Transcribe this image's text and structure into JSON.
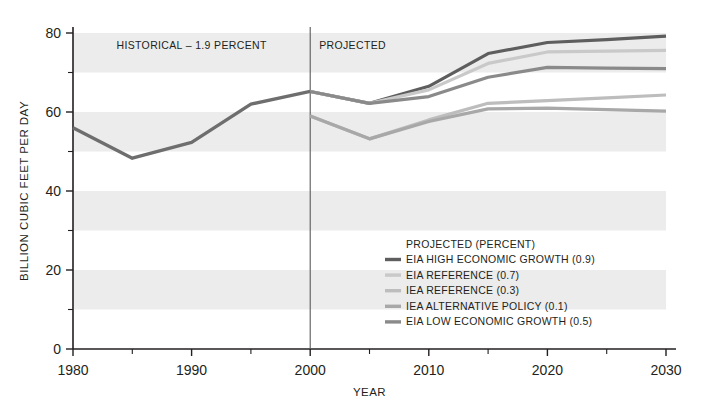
{
  "chart_data": {
    "type": "line",
    "title": "",
    "xlabel": "YEAR",
    "ylabel": "BILLION CUBIC FEET PER DAY",
    "xlim": [
      1980,
      2030
    ],
    "ylim": [
      0,
      80
    ],
    "xticks": [
      1980,
      1990,
      2000,
      2010,
      2020,
      2030
    ],
    "xtick_labels": [
      "1980",
      "1990",
      "2000",
      "2010",
      "2020",
      "2030"
    ],
    "xminor_ticks": [
      1985,
      1995,
      2005,
      2015,
      2025
    ],
    "yticks": [
      0,
      20,
      40,
      60,
      80
    ],
    "ytick_labels": [
      "0",
      "20",
      "40",
      "60",
      "80"
    ],
    "yminor_ticks": [
      10,
      30,
      50,
      70
    ],
    "grid": false,
    "bands": [
      [
        70,
        80
      ],
      [
        50,
        60
      ],
      [
        30,
        40
      ],
      [
        10,
        20
      ]
    ],
    "band_color": "#ececec",
    "divider_x": 2000,
    "legend_position": "inside-lower-right",
    "annotations": [
      {
        "name": "historical-label",
        "text": "HISTORICAL – 1.9 PERCENT",
        "x": 1990,
        "y": 77
      },
      {
        "name": "projected-label",
        "text": "PROJECTED",
        "x": 2003.5,
        "y": 77
      }
    ],
    "legend_title": "PROJECTED (PERCENT)",
    "series": [
      {
        "name": "EIA HIGH ECONOMIC GROWTH (0.9)",
        "label": "EIA HIGH ECONOMIC GROWTH (0.9)",
        "color": "#5e5e5e",
        "width": 3.2,
        "x": [
          2000,
          2005,
          2010,
          2015,
          2020,
          2025,
          2030
        ],
        "values": [
          65.2,
          62.2,
          66.5,
          74.8,
          77.6,
          78.3,
          79.2
        ]
      },
      {
        "name": "EIA REFERENCE (0.7)",
        "label": "EIA REFERENCE (0.7)",
        "color": "#c9c9c9",
        "width": 3.2,
        "x": [
          2000,
          2005,
          2010,
          2015,
          2020,
          2025,
          2030
        ],
        "values": [
          65.2,
          62.2,
          65.6,
          72.3,
          75.2,
          75.4,
          75.6
        ]
      },
      {
        "name": "IEA REFERENCE (0.3)",
        "label": "IEA REFERENCE (0.3)",
        "color": "#bdbdbd",
        "width": 3.2,
        "x": [
          2000,
          2005,
          2010,
          2015,
          2020,
          2025,
          2030
        ],
        "values": [
          59.0,
          53.2,
          58.0,
          62.2,
          62.9,
          63.6,
          64.3
        ]
      },
      {
        "name": "IEA ALTERNATIVE POLICY (0.1)",
        "label": "IEA ALTERNATIVE POLICY (0.1)",
        "color": "#a8a8a8",
        "width": 3.2,
        "x": [
          2000,
          2005,
          2010,
          2015,
          2020,
          2025,
          2030
        ],
        "values": [
          59.0,
          53.2,
          57.6,
          60.8,
          61.0,
          60.6,
          60.2
        ]
      },
      {
        "name": "EIA LOW ECONOMIC GROWTH (0.5)",
        "label": "EIA LOW ECONOMIC GROWTH (0.5)",
        "color": "#8a8a8a",
        "width": 3.2,
        "x": [
          2000,
          2005,
          2010,
          2015,
          2020,
          2025,
          2030
        ],
        "values": [
          65.2,
          62.2,
          63.9,
          68.8,
          71.3,
          71.1,
          71.0
        ]
      },
      {
        "name": "HISTORICAL",
        "label": "",
        "color": "#6e6e6e",
        "width": 3.4,
        "x": [
          1980,
          1985,
          1990,
          1995,
          2000
        ],
        "values": [
          56.0,
          48.3,
          52.3,
          62.0,
          65.2
        ]
      }
    ]
  },
  "legend": {
    "title": "PROJECTED (PERCENT)",
    "items": [
      {
        "label": "EIA HIGH ECONOMIC GROWTH (0.9)",
        "color": "#5e5e5e"
      },
      {
        "label": "EIA REFERENCE (0.7)",
        "color": "#c9c9c9"
      },
      {
        "label": "IEA REFERENCE (0.3)",
        "color": "#bdbdbd"
      },
      {
        "label": "IEA ALTERNATIVE POLICY (0.1)",
        "color": "#a8a8a8"
      },
      {
        "label": "EIA LOW ECONOMIC GROWTH (0.5)",
        "color": "#8a8a8a"
      }
    ]
  },
  "axes": {
    "x_title": "YEAR",
    "y_title": "BILLION CUBIC FEET PER DAY"
  },
  "labels": {
    "historical": "HISTORICAL – 1.9 PERCENT",
    "projected": "PROJECTED"
  }
}
